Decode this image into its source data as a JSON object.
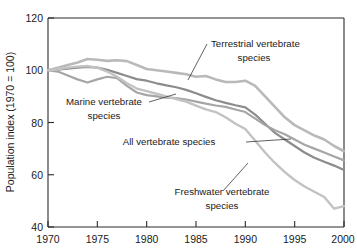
{
  "chart_data": {
    "type": "line",
    "title": "",
    "xlabel": "",
    "ylabel": "Population index (1970 = 100)",
    "xlim": [
      1970,
      2000
    ],
    "ylim": [
      40,
      120
    ],
    "grid": false,
    "legend_position": "inline-annotations",
    "xticks": [
      "1970",
      "1975",
      "1980",
      "1985",
      "1990",
      "1995",
      "2000"
    ],
    "yticks": [
      "40",
      "60",
      "80",
      "100",
      "120"
    ],
    "x": [
      1970,
      1971,
      1972,
      1973,
      1974,
      1975,
      1976,
      1977,
      1978,
      1979,
      1980,
      1981,
      1982,
      1983,
      1984,
      1985,
      1986,
      1987,
      1988,
      1989,
      1990,
      1991,
      1992,
      1993,
      1994,
      1995,
      1996,
      1997,
      1998,
      1999,
      2000
    ],
    "series": [
      {
        "name": "Terrestrial vertebrate species",
        "color": "#b9b9b9",
        "values": [
          100.0,
          101.0,
          102.0,
          103.0,
          104.3,
          104.0,
          103.6,
          103.8,
          103.5,
          102.0,
          100.5,
          100.0,
          99.5,
          99.0,
          98.5,
          97.5,
          97.8,
          96.5,
          95.5,
          95.5,
          96.0,
          94.0,
          90.0,
          86.0,
          82.0,
          79.0,
          77.0,
          75.0,
          73.5,
          71.0,
          69.0
        ]
      },
      {
        "name": "All vertebrate species",
        "color": "#8c8c8c",
        "values": [
          100.0,
          100.2,
          100.6,
          101.0,
          101.3,
          101.0,
          100.2,
          99.0,
          97.8,
          96.6,
          96.0,
          95.0,
          94.2,
          93.5,
          92.5,
          91.2,
          89.8,
          88.5,
          87.5,
          86.6,
          85.8,
          83.0,
          79.5,
          76.0,
          73.5,
          71.0,
          68.5,
          66.5,
          65.0,
          63.5,
          61.8
        ]
      },
      {
        "name": "Marine vertebrate species",
        "color": "#a6a6a6",
        "values": [
          100.0,
          99.5,
          98.0,
          96.5,
          95.3,
          96.5,
          97.5,
          97.0,
          94.0,
          91.5,
          90.5,
          90.0,
          89.5,
          89.3,
          88.8,
          88.0,
          87.2,
          86.5,
          86.0,
          85.0,
          84.0,
          81.5,
          79.0,
          77.0,
          75.5,
          73.5,
          71.5,
          70.0,
          68.5,
          67.0,
          65.5
        ]
      },
      {
        "name": "Freshwater vertebrate species",
        "color": "#c2c2c2",
        "values": [
          100.0,
          100.4,
          101.0,
          101.4,
          101.6,
          101.0,
          99.5,
          97.5,
          95.0,
          93.0,
          92.0,
          91.0,
          90.0,
          89.0,
          88.0,
          86.5,
          85.0,
          84.0,
          82.0,
          79.5,
          77.5,
          73.0,
          68.5,
          64.5,
          61.0,
          58.0,
          55.5,
          53.5,
          51.5,
          47.0,
          48.0
        ]
      }
    ],
    "annotations": [
      {
        "id": "terrestrial",
        "text_line1": "Terrestrial vertebrate",
        "text_line2": "species"
      },
      {
        "id": "marine",
        "text_line1": "Marine vertebrate",
        "text_line2": "species"
      },
      {
        "id": "all",
        "text_line1": "All vertebrate species",
        "text_line2": ""
      },
      {
        "id": "freshwater",
        "text_line1": "Freshwater vertebrate",
        "text_line2": "species"
      }
    ]
  }
}
